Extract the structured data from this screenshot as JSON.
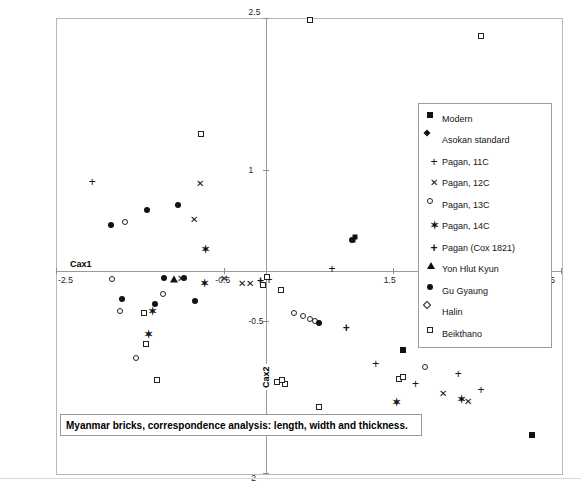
{
  "chart_data": {
    "type": "scatter",
    "title": "Myanmar bricks, correspondence analysis: length, width and thickness.",
    "xlabel": "Cax1",
    "ylabel": "Cax2",
    "xlim": [
      -2.5,
      3.5
    ],
    "ylim": [
      -2.0,
      2.5
    ],
    "xticks": [
      -2.5,
      -0.5,
      1.5,
      3.5
    ],
    "xtick_labels": [
      "-2.5",
      "-0.5",
      "1.5",
      "3.5"
    ],
    "yticks": [
      2.5,
      1,
      -0.5,
      -2
    ],
    "ytick_labels": [
      "2.5",
      "1",
      "-0.5",
      "-2"
    ],
    "grid": false,
    "legend_position": "right",
    "series": [
      {
        "name": "Modern",
        "marker": "square-filled",
        "points": [
          [
            3.15,
            -1.62
          ],
          [
            1.62,
            -0.78
          ]
        ]
      },
      {
        "name": "Asokan standard",
        "marker": "diamond-filled",
        "points": [
          [
            1.03,
            0.3
          ],
          [
            1.05,
            0.33
          ]
        ]
      },
      {
        "name": "Pagan, 11C",
        "marker": "plus",
        "points": [
          [
            -2.07,
            0.88
          ],
          [
            0.03,
            -0.09
          ],
          [
            0.78,
            0.02
          ],
          [
            1.3,
            -0.92
          ],
          [
            1.77,
            -1.12
          ],
          [
            2.28,
            -1.02
          ],
          [
            2.55,
            -1.18
          ]
        ]
      },
      {
        "name": "Pagan, 12C",
        "marker": "x",
        "points": [
          [
            -0.79,
            0.86
          ],
          [
            -0.86,
            0.5
          ],
          [
            -0.29,
            -0.13
          ],
          [
            -0.19,
            -0.13
          ],
          [
            -0.5,
            -0.08
          ],
          [
            -1.02,
            -0.08
          ],
          [
            2.1,
            -1.22
          ],
          [
            2.4,
            -1.3
          ]
        ]
      },
      {
        "name": "Pagan, 13C",
        "marker": "circle-open",
        "points": [
          [
            -1.68,
            0.48
          ],
          [
            -1.84,
            -0.08
          ],
          [
            -1.74,
            -0.4
          ],
          [
            -1.55,
            -0.86
          ],
          [
            -1.23,
            -0.23
          ],
          [
            0.33,
            -0.42
          ],
          [
            0.43,
            -0.45
          ],
          [
            0.52,
            -0.48
          ],
          [
            0.58,
            -0.5
          ],
          [
            1.88,
            -0.95
          ]
        ]
      },
      {
        "name": "Pagan, 14C",
        "marker": "star",
        "points": [
          [
            -0.72,
            0.22
          ],
          [
            -1.35,
            -0.4
          ],
          [
            -0.73,
            -0.12
          ],
          [
            -1.4,
            -0.63
          ],
          [
            1.55,
            -1.3
          ],
          [
            2.32,
            -1.27
          ]
        ]
      },
      {
        "name": "Pagan (Cox 1821)",
        "marker": "plus-bold",
        "points": [
          [
            -0.07,
            -0.1
          ],
          [
            0.95,
            -0.57
          ]
        ]
      },
      {
        "name": "Yon Hlut Kyun",
        "marker": "triangle-filled",
        "points": [
          [
            -1.1,
            -0.08
          ]
        ]
      },
      {
        "name": "Gu Gyaung",
        "marker": "circle-filled",
        "points": [
          [
            -1.42,
            0.6
          ],
          [
            -1.05,
            0.65
          ],
          [
            -1.85,
            0.45
          ],
          [
            -1.22,
            -0.07
          ],
          [
            -0.98,
            -0.07
          ],
          [
            -1.72,
            -0.28
          ],
          [
            -1.32,
            -0.33
          ],
          [
            -0.85,
            -0.3
          ],
          [
            0.62,
            -0.52
          ],
          [
            1.02,
            0.3
          ]
        ]
      },
      {
        "name": "Halin",
        "marker": "diamond-open",
        "points": [
          [
            -0.78,
            1.35
          ],
          [
            2.55,
            2.32
          ],
          [
            -1.45,
            -0.42
          ],
          [
            -1.43,
            -0.72
          ],
          [
            -1.3,
            -1.08
          ],
          [
            0.22,
            -1.12
          ],
          [
            1.58,
            -1.07
          ],
          [
            1.62,
            -1.05
          ]
        ]
      },
      {
        "name": "Beikthano",
        "marker": "square-open",
        "points": [
          [
            0.52,
            2.48
          ],
          [
            0.01,
            -0.06
          ],
          [
            -0.04,
            -0.14
          ],
          [
            0.17,
            -0.19
          ],
          [
            0.12,
            -1.1
          ],
          [
            0.18,
            -1.08
          ],
          [
            0.62,
            -1.35
          ]
        ]
      }
    ]
  },
  "axis": {
    "x_label": "Cax1",
    "y_label": "Cax2",
    "x_ticks": [
      "-2.5",
      "-0.5",
      "1.5",
      "3.5"
    ],
    "y_ticks": [
      "2.5",
      "1",
      "-0.5",
      "-2"
    ]
  },
  "legend": {
    "items": [
      {
        "label": "Modern",
        "marker": "square-filled"
      },
      {
        "label": "Asokan standard",
        "marker": "diamond-filled"
      },
      {
        "label": "Pagan, 11C",
        "marker": "plus"
      },
      {
        "label": "Pagan, 12C",
        "marker": "x"
      },
      {
        "label": "Pagan, 13C",
        "marker": "circle-open"
      },
      {
        "label": "Pagan, 14C",
        "marker": "star"
      },
      {
        "label": "Pagan (Cox 1821)",
        "marker": "plus-bold"
      },
      {
        "label": "Yon Hlut Kyun",
        "marker": "triangle-filled"
      },
      {
        "label": "Gu Gyaung",
        "marker": "circle-filled"
      },
      {
        "label": "Halin",
        "marker": "diamond-open"
      },
      {
        "label": "Beikthano",
        "marker": "square-open"
      }
    ]
  },
  "caption": {
    "text": "Myanmar bricks, correspondence analysis: length, width and thickness."
  },
  "colors": {
    "marker": "#111111",
    "frame": "#b9b9b9",
    "axis": "#9a9a9a",
    "background": "#ffffff"
  }
}
